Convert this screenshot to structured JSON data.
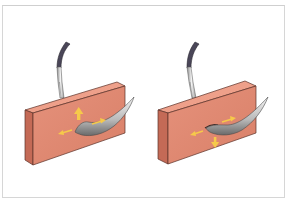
{
  "figure": {
    "panels": [
      {
        "id": "left",
        "description": "Tissue block with curved needle entering; arrows indicate lateral and upward displacement",
        "arrows": [
          "left",
          "up",
          "right"
        ]
      },
      {
        "id": "right",
        "description": "Tissue block with curved needle passing through; arrows indicate lateral and downward displacement",
        "arrows": [
          "left",
          "right",
          "down"
        ]
      }
    ],
    "colors": {
      "block_front": "#e08a74",
      "block_top": "#eea08a",
      "block_side": "#c46a56",
      "block_outline": "#5a3028",
      "arrow": "#f6c94a",
      "needle": "#c9c9c9",
      "needle_dark": "#6f6f6f",
      "holder_cable": "#4a4658",
      "frame": "#d6d6d6"
    }
  }
}
